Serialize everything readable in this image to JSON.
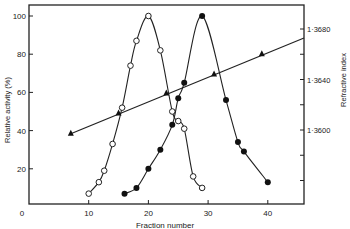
{
  "chart_data": {
    "type": "line",
    "title": "",
    "xlabel": "Fraction number",
    "ylabel": "Relative activity (%)",
    "y2label": "Refractive index",
    "xlim": [
      0,
      46
    ],
    "ylim": [
      0,
      105
    ],
    "y2lim": [
      1.3545,
      1.37
    ],
    "xticks": [
      0,
      10,
      20,
      30,
      40
    ],
    "xtick_labels": [
      "0",
      "10",
      "20",
      "30",
      "40"
    ],
    "yticks": [
      20,
      40,
      60,
      80,
      100
    ],
    "ytick_labels": [
      "20",
      "40",
      "60",
      "80",
      "100"
    ],
    "y2ticks": [
      1.356,
      1.358,
      1.36,
      1.362,
      1.364,
      1.366,
      1.368
    ],
    "y2tick_labels": [
      "",
      "",
      "1·3600",
      "",
      "1·3640",
      "",
      "1·3680"
    ],
    "grid": false,
    "legend": null,
    "series": [
      {
        "name": "Open circles (activity peak 1)",
        "marker": "open-circle",
        "axis": "left",
        "x": [
          10,
          11.7,
          12.6,
          14,
          15.6,
          17,
          18,
          20,
          22,
          24,
          25,
          26,
          27.5,
          29
        ],
        "y": [
          7,
          13,
          19,
          33,
          52,
          74,
          87,
          100,
          82,
          50,
          45,
          41,
          16,
          10
        ]
      },
      {
        "name": "Filled circles (activity peak 2)",
        "marker": "filled-circle",
        "axis": "left",
        "x": [
          16,
          18,
          20,
          22,
          24,
          25,
          26,
          29,
          33,
          35,
          36,
          40
        ],
        "y": [
          7,
          10,
          20,
          30,
          43,
          57,
          65,
          100,
          56,
          34,
          29,
          13
        ]
      },
      {
        "name": "Triangles (refractive index)",
        "marker": "triangle",
        "axis": "right",
        "x": [
          7,
          15,
          23,
          31,
          39
        ],
        "y": [
          1.3597,
          1.3613,
          1.3629,
          1.3644,
          1.366
        ]
      }
    ]
  }
}
